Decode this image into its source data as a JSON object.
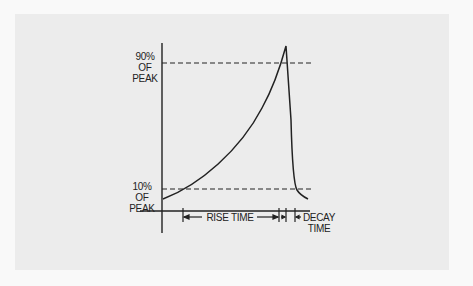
{
  "diagram": {
    "type": "pulse-waveform",
    "labels": {
      "peak_90": [
        "90%",
        "OF PEAK"
      ],
      "peak_10": [
        "10%",
        "OF PEAK"
      ],
      "rise_time": "RISE TIME",
      "decay_time": [
        "DECAY",
        "TIME"
      ]
    },
    "colors": {
      "panel": "#ececec",
      "background": "#f9f9f9",
      "ink": "#222222"
    }
  }
}
